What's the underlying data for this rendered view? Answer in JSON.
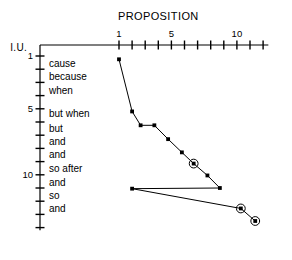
{
  "chart_data": {
    "type": "line",
    "title": "PROPOSITION",
    "xlabel": "PROPOSITION",
    "ylabel": "I.U.",
    "x_axis_position": "top",
    "y_axis_direction": "down",
    "grid": false,
    "legend": null,
    "xlim": [
      0,
      12
    ],
    "ylim": [
      0,
      14
    ],
    "x_ticks": [
      1,
      2,
      3,
      4,
      5,
      6,
      7,
      8,
      9,
      10,
      11,
      12
    ],
    "x_tick_labels": [
      "1",
      "",
      "",
      "",
      "5",
      "",
      "",
      "",
      "",
      "10",
      "",
      ""
    ],
    "y_ticks": [
      1,
      2,
      3,
      4,
      5,
      6,
      7,
      8,
      9,
      10,
      11,
      12,
      13,
      14
    ],
    "y_tick_labels": [
      "1",
      "",
      "",
      "",
      "5",
      "",
      "",
      "",
      "",
      "10",
      "",
      "",
      "",
      ""
    ],
    "y_category_labels": [
      {
        "y": 1.6,
        "text": "cause"
      },
      {
        "y": 2.6,
        "text": "because"
      },
      {
        "y": 3.6,
        "text": "when"
      },
      {
        "y": 5.4,
        "text": "but when"
      },
      {
        "y": 6.5,
        "text": "but"
      },
      {
        "y": 7.5,
        "text": "and"
      },
      {
        "y": 8.5,
        "text": "and"
      },
      {
        "y": 9.5,
        "text": "so after"
      },
      {
        "y": 10.6,
        "text": "and"
      },
      {
        "y": 11.6,
        "text": "so"
      },
      {
        "y": 12.6,
        "text": "and"
      }
    ],
    "series": [
      {
        "name": "main",
        "marker": "filled-square",
        "points": [
          {
            "x": 1.0,
            "y": 1.25,
            "circled": false
          },
          {
            "x": 2.0,
            "y": 5.2,
            "circled": false
          },
          {
            "x": 2.65,
            "y": 6.25,
            "circled": false
          },
          {
            "x": 3.7,
            "y": 6.25,
            "circled": false
          },
          {
            "x": 4.75,
            "y": 7.3,
            "circled": false
          },
          {
            "x": 5.8,
            "y": 8.3,
            "circled": false
          },
          {
            "x": 6.7,
            "y": 9.15,
            "circled": true
          },
          {
            "x": 7.75,
            "y": 10.05,
            "circled": false
          },
          {
            "x": 8.7,
            "y": 11.0,
            "circled": false
          }
        ]
      },
      {
        "name": "lower",
        "marker": "filled-square",
        "points": [
          {
            "x": 2.0,
            "y": 11.05,
            "circled": false
          },
          {
            "x": 10.3,
            "y": 12.55,
            "circled": true
          },
          {
            "x": 11.4,
            "y": 13.5,
            "circled": true
          }
        ]
      }
    ],
    "connector": {
      "from": [
        8.7,
        11.0
      ],
      "to": [
        2.0,
        11.05
      ]
    }
  }
}
